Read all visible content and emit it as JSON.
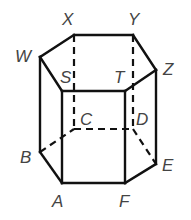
{
  "diagram": {
    "vertices": {
      "X": {
        "x": 74,
        "y": 35,
        "label": "X",
        "lx": 62,
        "ly": 25
      },
      "Y": {
        "x": 133,
        "y": 35,
        "label": "Y",
        "lx": 128,
        "ly": 25
      },
      "W": {
        "x": 40,
        "y": 57,
        "label": "W",
        "lx": 15,
        "ly": 62
      },
      "Z": {
        "x": 156,
        "y": 70,
        "label": "Z",
        "lx": 163,
        "ly": 75
      },
      "S": {
        "x": 62,
        "y": 91,
        "label": "S",
        "lx": 60,
        "ly": 83
      },
      "T": {
        "x": 125,
        "y": 91,
        "label": "T",
        "lx": 114,
        "ly": 83
      },
      "C": {
        "x": 74,
        "y": 129,
        "label": "C",
        "lx": 80,
        "ly": 125
      },
      "D": {
        "x": 133,
        "y": 129,
        "label": "D",
        "lx": 136,
        "ly": 125
      },
      "B": {
        "x": 40,
        "y": 152,
        "label": "B",
        "lx": 20,
        "ly": 163
      },
      "E": {
        "x": 156,
        "y": 164,
        "label": "E",
        "lx": 162,
        "ly": 171
      },
      "A": {
        "x": 62,
        "y": 183,
        "label": "A",
        "lx": 52,
        "ly": 207
      },
      "F": {
        "x": 125,
        "y": 183,
        "label": "F",
        "lx": 119,
        "ly": 207
      }
    },
    "visible_edges": [
      [
        "W",
        "X"
      ],
      [
        "X",
        "Y"
      ],
      [
        "Y",
        "Z"
      ],
      [
        "Z",
        "T"
      ],
      [
        "T",
        "S"
      ],
      [
        "S",
        "W"
      ],
      [
        "W",
        "B"
      ],
      [
        "S",
        "A"
      ],
      [
        "T",
        "F"
      ],
      [
        "Z",
        "E"
      ],
      [
        "B",
        "A"
      ],
      [
        "A",
        "F"
      ],
      [
        "F",
        "E"
      ]
    ],
    "hidden_edges": [
      [
        "X",
        "C"
      ],
      [
        "Y",
        "D"
      ],
      [
        "B",
        "C"
      ],
      [
        "C",
        "D"
      ],
      [
        "D",
        "E"
      ]
    ]
  }
}
